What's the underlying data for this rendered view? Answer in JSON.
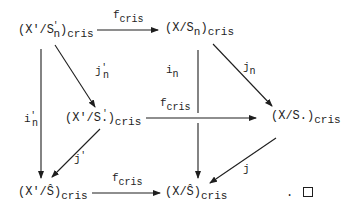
{
  "diagram": {
    "type": "commutative-diagram",
    "nodes": {
      "top_left": {
        "base": "(X'/S",
        "sup": "'",
        "sub_n": "n",
        "close": ")",
        "sub": "cris"
      },
      "top_right": {
        "base": "(X/S",
        "sub_n": "n",
        "close": ")",
        "sub": "cris"
      },
      "mid_left": {
        "base": "(X'/S",
        "dot": ".",
        "sup": "'",
        "close": ")",
        "sub": "cris"
      },
      "mid_right": {
        "base": "(X/S.)",
        "sub": "cris"
      },
      "bottom_left": {
        "base": "(X'/Ŝ)",
        "sub": "cris"
      },
      "bottom_right": {
        "base": "(X/Ŝ)",
        "sub": "cris"
      }
    },
    "arrows": {
      "top": {
        "label": "f",
        "sub": "cris"
      },
      "middle": {
        "label": "f",
        "sub": "cris"
      },
      "bottom": {
        "label": "f",
        "sub": "cris"
      },
      "jn_prime": {
        "label": "j",
        "sub": "n",
        "sup": "'"
      },
      "jn": {
        "label": "j",
        "sub": "n"
      },
      "in_prime": {
        "label": "i",
        "sub": "n",
        "sup": "'"
      },
      "in": {
        "label": "i",
        "sub": "n"
      },
      "j_prime": {
        "label": "j",
        "sup": "'"
      },
      "j": {
        "label": "j"
      }
    },
    "end_mark": {
      "period": ".",
      "symbol": "qed-box"
    },
    "colors": {
      "ink": "#1e1e1e",
      "background": "#ffffff"
    }
  }
}
